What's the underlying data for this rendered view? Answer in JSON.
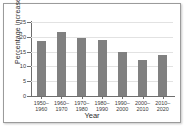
{
  "chart_data": {
    "type": "bar",
    "title": "",
    "xlabel": "Year",
    "ylabel": "Percentage increase",
    "categories": [
      "1950–\n1960",
      "1960–\n1970",
      "1970–\n1980",
      "1980–\n1990",
      "1990–\n2000",
      "2000–\n2010",
      "2010–\n2020"
    ],
    "category_lines": [
      [
        "1950–",
        "1960"
      ],
      [
        "1960–",
        "1970"
      ],
      [
        "1970–",
        "1980"
      ],
      [
        "1980–",
        "1990"
      ],
      [
        "1990–",
        "2000"
      ],
      [
        "2000–",
        "2010"
      ],
      [
        "2010–",
        "2020"
      ]
    ],
    "values": [
      18.5,
      21.5,
      19.5,
      19.0,
      14.8,
      12.0,
      14.0
    ],
    "ylim": [
      0,
      25
    ],
    "yticks": [
      0,
      5,
      10,
      15,
      20,
      25
    ],
    "ytick_labels": [
      "0",
      "5",
      "10",
      "15",
      "20",
      "25"
    ],
    "grid": true,
    "legend": false,
    "bar_color": "#808080",
    "axis_color": "#6e6e6e",
    "grid_color": "#e2e2e2",
    "background_color": "#ffffff",
    "frame_color": "#9b9b9b"
  }
}
